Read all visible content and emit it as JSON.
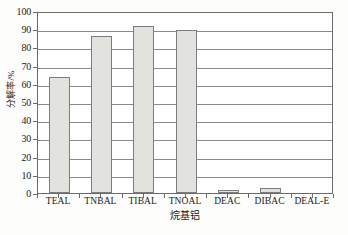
{
  "chart_data": {
    "type": "bar",
    "title": "",
    "subtitle": "",
    "xlabel": "烷基铝",
    "ylabel": "分解率/%",
    "categories": [
      "TEAL",
      "TNBAL",
      "TIBAL",
      "TNOAL",
      "DEAC",
      "DIBAC",
      "DEAL-E"
    ],
    "values": [
      63.5,
      86.5,
      91.5,
      89.5,
      1.5,
      3.0,
      0.0
    ],
    "ylim": [
      0,
      100
    ],
    "ytick_labels": [
      "0",
      "10",
      "20",
      "30",
      "40",
      "50",
      "60",
      "70",
      "80",
      "90",
      "100"
    ],
    "ytick_values": [
      0,
      10,
      20,
      30,
      40,
      50,
      60,
      70,
      80,
      90,
      100
    ],
    "grid": "horizontal",
    "legend": "none",
    "series": [
      {
        "name": "分解率",
        "values": [
          63.5,
          86.5,
          91.5,
          89.5,
          1.5,
          3.0,
          0.0
        ]
      }
    ],
    "colors": {
      "bar_fill": "#e2e2df",
      "bar_edge": "#7c7c7c",
      "grid": "#8a8a8a",
      "frame": "#6b6b6b",
      "background": "#ffffff",
      "text": "#1a1a1a"
    }
  }
}
